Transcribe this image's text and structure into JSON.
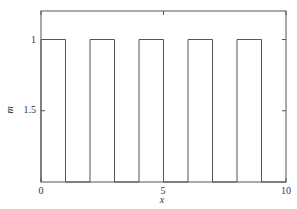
{
  "chart_data": {
    "type": "line",
    "title": "",
    "xlabel": "x",
    "ylabel": "m",
    "xlim": [
      0,
      10
    ],
    "ylim": [
      2,
      0.8
    ],
    "y_inverted": true,
    "grid": false,
    "legend": null,
    "x_ticks": [
      0,
      5,
      10
    ],
    "x_tick_labels": [
      "0",
      "5",
      "10"
    ],
    "y_ticks": [
      1,
      1.5
    ],
    "y_tick_labels": [
      "1",
      "1.5"
    ],
    "series": [
      {
        "name": "m(x)",
        "step": true,
        "x": [
          0,
          0,
          1,
          1,
          2,
          2,
          3,
          3,
          4,
          4,
          5,
          5,
          6,
          6,
          7,
          7,
          8,
          8,
          9,
          9,
          10
        ],
        "y": [
          2,
          1,
          1,
          2,
          2,
          1,
          1,
          2,
          2,
          1,
          1,
          2,
          2,
          1,
          1,
          2,
          2,
          1,
          1,
          2,
          2
        ]
      }
    ],
    "pulses": [
      {
        "start": 0,
        "end": 1,
        "value": 1
      },
      {
        "start": 2,
        "end": 3,
        "value": 1
      },
      {
        "start": 4,
        "end": 5,
        "value": 1
      },
      {
        "start": 6,
        "end": 7,
        "value": 1
      },
      {
        "start": 8,
        "end": 9,
        "value": 1
      }
    ],
    "baseline": 2,
    "colors": {
      "line": "#555555",
      "axis": "#555555",
      "text": "#333333"
    }
  },
  "labels": {
    "xlabel": "x",
    "ylabel": "m",
    "xtick_0": "0",
    "xtick_5": "5",
    "xtick_10": "10",
    "ytick_1": "1",
    "ytick_1_5": "1.5"
  }
}
